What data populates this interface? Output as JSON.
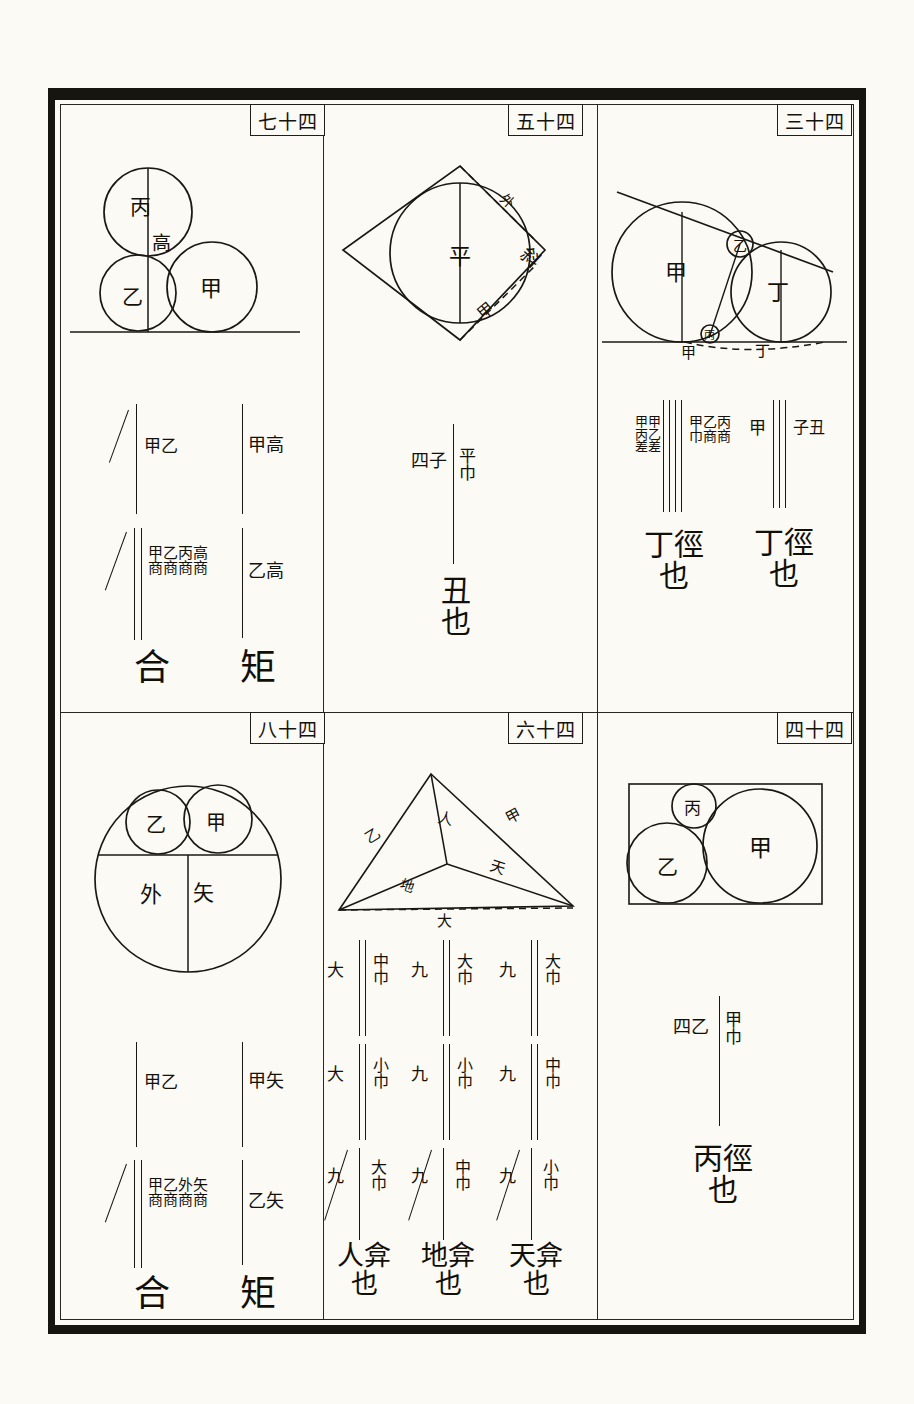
{
  "page": {
    "kind": "woodblock-printed classical Chinese mathematics diagram page",
    "frame_color": "#171510",
    "ink_color": "#1b1814",
    "paper_color": "#fbfaf5"
  },
  "panels": [
    {
      "id": "p74",
      "number_label": "七十四",
      "position": "top-left",
      "figure": {
        "type": "three-circles-on-line",
        "circle_labels": [
          "丙",
          "乙",
          "甲"
        ],
        "segment_label": "高",
        "baseline": true
      },
      "formulas": [
        {
          "column": "right",
          "terms": [
            "甲高",
            "乙高"
          ],
          "result": "矩",
          "strike": false
        },
        {
          "column": "left",
          "terms": [
            "甲乙",
            "甲乙丙高/商商商商"
          ],
          "term_upper": "甲乙",
          "term_lower_top": "甲乙丙高",
          "term_lower_bottom": "商商商商",
          "result": "合",
          "strike": true
        }
      ]
    },
    {
      "id": "p54",
      "number_label": "五十四",
      "position": "top-middle",
      "figure": {
        "type": "rhombus-with-inscribed-circle",
        "center_label": "平",
        "edge_labels": [
          "外",
          "斜",
          "甲"
        ],
        "dashed_edges": true
      },
      "formulas": [
        {
          "column": "center",
          "term_left": "四子",
          "term_right_top": "平",
          "term_right_bottom": "巾",
          "result": "丑也",
          "strike": false
        }
      ]
    },
    {
      "id": "p34",
      "number_label": "三十四",
      "position": "top-right",
      "figure": {
        "type": "two-circles-tangent-line",
        "circle_labels": [
          "甲",
          "丁"
        ],
        "tangent_point_labels": [
          "乙",
          "丙"
        ],
        "baseline_labels": [
          "甲",
          "丁"
        ],
        "dashed_baseline": true
      },
      "formulas": [
        {
          "column": "right",
          "term_left": "甲",
          "term_right": "子丑",
          "result": "丁徑也",
          "strike": false
        },
        {
          "column": "left",
          "term_left_top": "甲甲",
          "term_left_mid": "丙乙",
          "term_left_bottom": "差差",
          "term_right_top": "甲乙丙",
          "term_right_bottom": "巾商商",
          "result": "丁徑也",
          "strike": false
        }
      ]
    },
    {
      "id": "p84",
      "number_label": "八十四",
      "position": "bottom-left",
      "figure": {
        "type": "circle-with-chord-and-two-small-circles",
        "small_circle_labels": [
          "乙",
          "甲"
        ],
        "region_labels": [
          "外",
          "矢"
        ],
        "chord": true
      },
      "formulas": [
        {
          "column": "right",
          "terms": [
            "甲矢",
            "乙矢"
          ],
          "result": "矩",
          "strike": false
        },
        {
          "column": "left",
          "term_upper": "甲乙",
          "term_lower_top": "甲乙外矢",
          "term_lower_bottom": "商商商商",
          "result": "合",
          "strike": true
        }
      ]
    },
    {
      "id": "p64",
      "number_label": "六十四",
      "position": "bottom-middle",
      "figure": {
        "type": "triangle-with-interior-point",
        "edge_labels": [
          "乙",
          "人",
          "甲",
          "天",
          "地",
          "大"
        ]
      },
      "formula_grid": {
        "columns": [
          {
            "cells": [
              {
                "left": "九",
                "right_top": "大",
                "right_bottom": "巾",
                "strike": false
              },
              {
                "left": "九",
                "right_top": "中",
                "right_bottom": "巾",
                "strike": false
              },
              {
                "left": "九",
                "right_top": "小",
                "right_bottom": "巾",
                "strike": true
              }
            ],
            "result": "天弇也"
          },
          {
            "cells": [
              {
                "left": "九",
                "right_top": "大",
                "right_bottom": "巾",
                "strike": false
              },
              {
                "left": "九",
                "right_top": "小",
                "right_bottom": "巾",
                "strike": false
              },
              {
                "left": "九",
                "right_top": "中",
                "right_bottom": "巾",
                "strike": true
              }
            ],
            "result": "地弇也"
          },
          {
            "cells": [
              {
                "left": "大",
                "right_top": "中",
                "right_bottom": "巾",
                "strike": false
              },
              {
                "left": "大",
                "right_top": "小",
                "right_bottom": "巾",
                "strike": false
              },
              {
                "left": "九",
                "right_top": "大",
                "right_bottom": "巾",
                "strike": true
              }
            ],
            "result": "人弇也"
          }
        ]
      }
    },
    {
      "id": "p44",
      "number_label": "四十四",
      "position": "bottom-right",
      "figure": {
        "type": "three-circles-in-rectangle",
        "circle_labels": [
          "丙",
          "乙",
          "甲"
        ],
        "rectangle": true
      },
      "formulas": [
        {
          "column": "center",
          "term_left": "四乙",
          "term_right_top": "甲",
          "term_right_bottom": "巾",
          "result": "丙徑也",
          "strike": false
        }
      ]
    }
  ]
}
